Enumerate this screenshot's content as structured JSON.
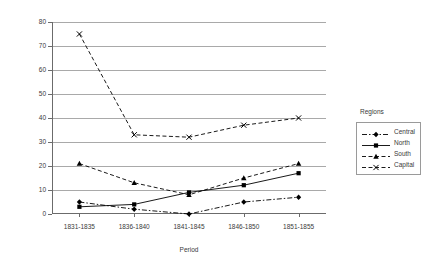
{
  "chart_data": {
    "type": "line",
    "title": "",
    "xlabel": "Period",
    "ylabel": "Number",
    "categories": [
      "1831-1835",
      "1836-1840",
      "1841-1845",
      "1846-1850",
      "1851-1855"
    ],
    "ylim": [
      0,
      80
    ],
    "ytick_values": [
      0,
      10,
      20,
      30,
      40,
      50,
      60,
      70,
      80
    ],
    "grid": true,
    "legend_position": "right",
    "legend_title": "Regions",
    "series": [
      {
        "name": "Central",
        "values": [
          5,
          2,
          0,
          5,
          7
        ],
        "marker": "diamond",
        "dash": "dash-dot"
      },
      {
        "name": "North",
        "values": [
          3,
          4,
          9,
          12,
          17
        ],
        "marker": "square",
        "dash": "solid"
      },
      {
        "name": "South",
        "values": [
          21,
          13,
          8,
          15,
          21
        ],
        "marker": "triangle",
        "dash": "dashed"
      },
      {
        "name": "Capital",
        "values": [
          75,
          33,
          32,
          37,
          40
        ],
        "marker": "cross",
        "dash": "dashed"
      }
    ]
  },
  "colors": {
    "series": "#000000",
    "grid": "#a9a9a9",
    "axis": "#6b6b6b",
    "text": "#3a3a3a",
    "background": "#ffffff"
  }
}
